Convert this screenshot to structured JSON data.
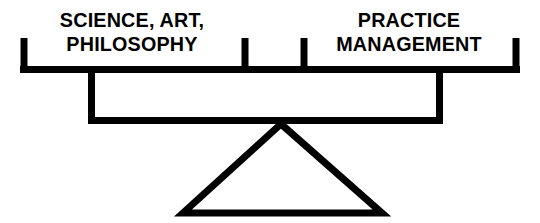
{
  "diagram": {
    "type": "balance-scale",
    "stroke_color": "#000000",
    "background_color": "#ffffff",
    "stroke_width": 7,
    "pans": [
      {
        "side": "left",
        "label_line_1": "SCIENCE, ART,",
        "label_line_2": "PHILOSOPHY"
      },
      {
        "side": "right",
        "label_line_1": "PRACTICE",
        "label_line_2": "MANAGEMENT"
      }
    ],
    "beam": {
      "name": "horizontal-beam",
      "x_start": 20,
      "x_end": 520,
      "y": 69
    },
    "ticks": {
      "left_end_x": 24,
      "inner_left_x": 245,
      "inner_right_x": 304,
      "right_end_x": 516,
      "top_y": 38,
      "bottom_y": 73
    },
    "hanger": {
      "name": "support-frame",
      "x_left": 91,
      "x_right": 440,
      "y_top": 69,
      "y_bottom": 121
    },
    "fulcrum": {
      "name": "triangle-fulcrum",
      "apex_x": 281,
      "apex_y": 124,
      "base_left_x": 183,
      "base_right_x": 382,
      "base_y": 213
    }
  }
}
